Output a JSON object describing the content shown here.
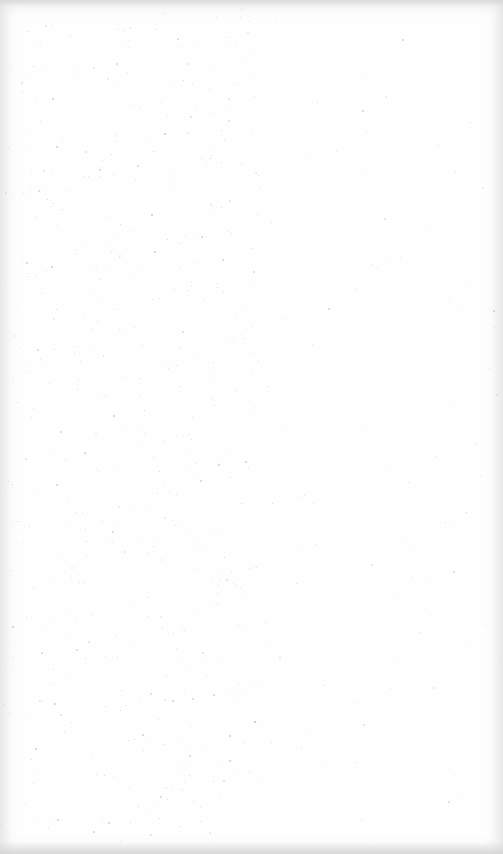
{
  "page": {
    "description": "",
    "background_color": "#fefefe",
    "speck_color": "#9a9a9a",
    "speck_density": {
      "left_region_count": 520,
      "right_region_count": 90,
      "left_region_width": 260
    },
    "seed": 7
  }
}
